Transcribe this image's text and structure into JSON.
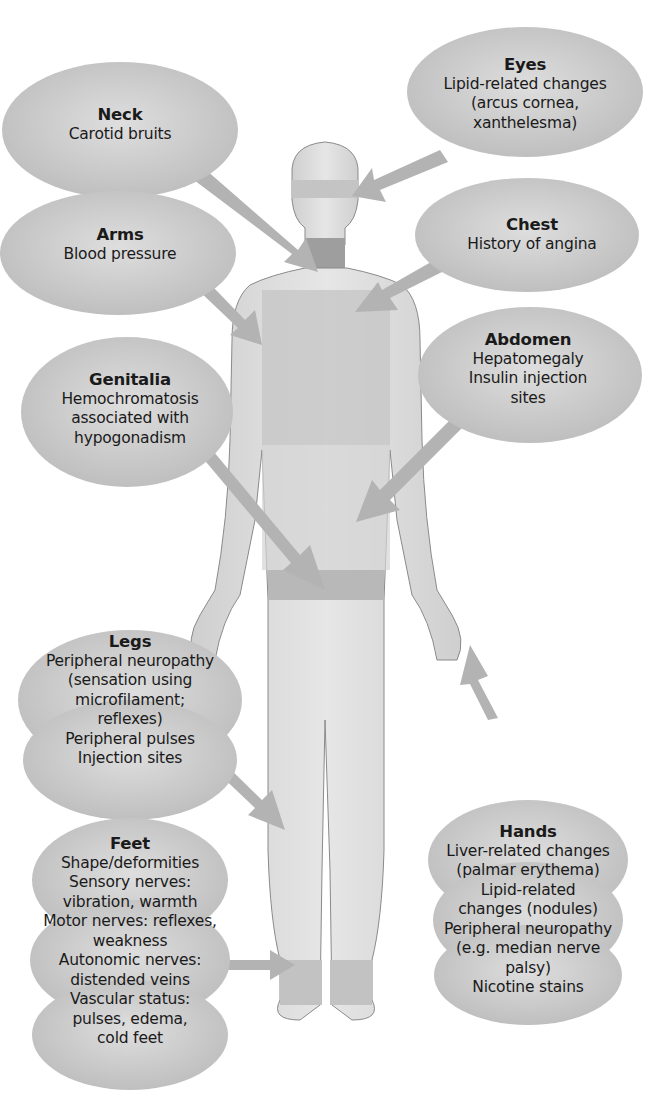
{
  "figure": {
    "type": "anatomical-callout-diagram"
  },
  "colors": {
    "background": "#ffffff",
    "bubble_fill": "#cfcfcf",
    "bubble_fill_dark": "#b5b5b5",
    "body_fill": "#d9d9d9",
    "body_band": "#bdbdbd",
    "neck_band": "#9a9a9a",
    "arrow": "#b0b0b0",
    "text": "#1a1a1a"
  },
  "callouts": {
    "neck": {
      "title": "Neck",
      "lines": [
        "Carotid bruits"
      ]
    },
    "eyes": {
      "title": "Eyes",
      "lines": [
        "Lipid-related changes",
        "(arcus cornea,",
        "xanthelesma)"
      ]
    },
    "arms": {
      "title": "Arms",
      "lines": [
        "Blood pressure"
      ]
    },
    "chest": {
      "title": "Chest",
      "lines": [
        "History of angina"
      ]
    },
    "abdomen": {
      "title": "Abdomen",
      "lines": [
        "Hepatomegaly",
        "Insulin injection",
        "sites"
      ]
    },
    "genitalia": {
      "title": "Genitalia",
      "lines": [
        "Hemochromatosis",
        "associated with",
        "hypogonadism"
      ]
    },
    "legs": {
      "title": "Legs",
      "lines": [
        "Peripheral neuropathy",
        "(sensation using",
        "microfilament;",
        "reflexes)",
        "Peripheral pulses",
        "Injection sites"
      ]
    },
    "hands": {
      "title": "Hands",
      "lines": [
        "Liver-related changes",
        "(palmar erythema)",
        "Lipid-related",
        "changes (nodules)",
        "Peripheral neuropathy",
        "(e.g. median nerve",
        "palsy)",
        "Nicotine stains"
      ]
    },
    "feet": {
      "title": "Feet",
      "lines": [
        "Shape/deformities",
        "Sensory nerves:",
        "vibration, warmth",
        "Motor nerves: reflexes,",
        "weakness",
        "Autonomic nerves:",
        "distended veins",
        "Vascular status:",
        "pulses, edema,",
        "cold feet"
      ]
    }
  }
}
